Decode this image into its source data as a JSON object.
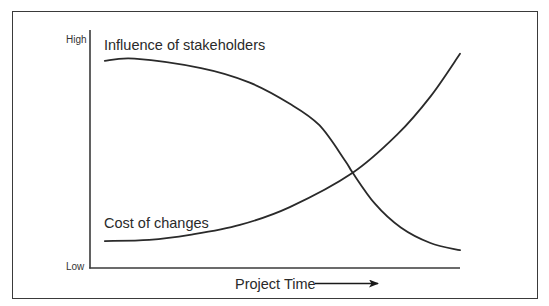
{
  "chart_data": {
    "type": "line",
    "title": "",
    "xlabel": "Project Time",
    "ylabel": "",
    "x_direction_arrow": true,
    "ytick_labels": {
      "low": "Low",
      "high": "High"
    },
    "xlim": [
      0,
      100
    ],
    "ylim": [
      0,
      100
    ],
    "grid": false,
    "legend": "none (direct labels on curves)",
    "series": [
      {
        "name": "Influence of stakeholders",
        "label_position": "above-start",
        "x": [
          4,
          12,
          30,
          43,
          54,
          62,
          69,
          71,
          77,
          84,
          92,
          100
        ],
        "y": [
          87,
          88,
          84,
          78,
          69,
          60,
          45,
          40,
          27,
          17,
          10.5,
          7.5
        ]
      },
      {
        "name": "Cost of changes",
        "label_position": "above-start",
        "x": [
          4,
          16,
          27,
          40.5,
          54,
          71,
          83,
          92,
          100
        ],
        "y": [
          11.3,
          11.8,
          13.9,
          18.1,
          25.6,
          40,
          56,
          72,
          90
        ]
      }
    ],
    "annotations": []
  }
}
